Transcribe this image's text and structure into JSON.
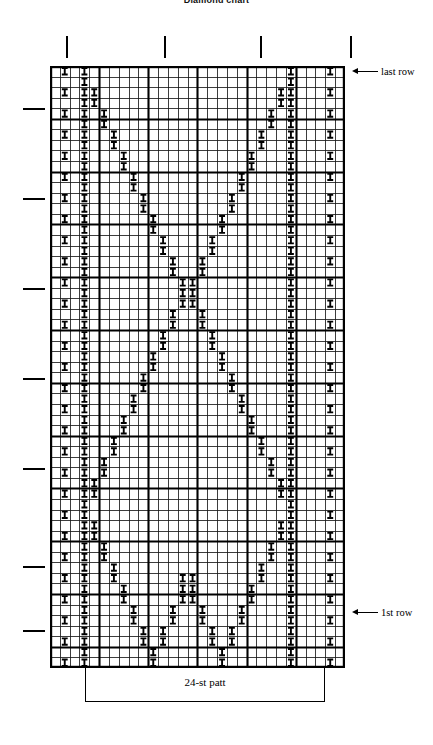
{
  "title": "Diamond chart",
  "annotations": {
    "last_row": "last row",
    "first_row": "1st row",
    "pattern_repeat": "24-st patt"
  },
  "chart_data": {
    "type": "table",
    "title": "Diamond chart",
    "xlabel": "",
    "ylabel": "",
    "symbol": "I",
    "columns": 30,
    "rows": 57,
    "repeat_stitches": 24,
    "repeat_start_col": 4,
    "repeat_end_col": 27,
    "cell_width": 9.833,
    "cell_height": 10.561,
    "heavy_col_every": 5,
    "heavy_row_every": 5,
    "row_order": "row 1 at bottom, last row at top",
    "col_ticks": [
      66,
      164,
      260,
      350
    ],
    "row_ticks": [
      108,
      198,
      288,
      378,
      468,
      566,
      630
    ],
    "grid_left": 50,
    "grid_top": 66,
    "grid_right": 345,
    "grid_bottom": 668,
    "marked_cells_by_row": [
      [
        3,
        10,
        17,
        24
      ],
      [
        3,
        10,
        17,
        24
      ],
      [
        3,
        9,
        11,
        16,
        18,
        24
      ],
      [
        3,
        9,
        11,
        16,
        18,
        24
      ],
      [
        3,
        8,
        12,
        15,
        19,
        24
      ],
      [
        3,
        8,
        12,
        15,
        19,
        24
      ],
      [
        3,
        7,
        13,
        14,
        20,
        24
      ],
      [
        3,
        7,
        13,
        14,
        20,
        24
      ],
      [
        3,
        6,
        14,
        13,
        21,
        24
      ],
      [
        3,
        6,
        21,
        24
      ],
      [
        3,
        5,
        22,
        24
      ],
      [
        3,
        5,
        22,
        24
      ],
      [
        3,
        4,
        23,
        24
      ],
      [
        3,
        4,
        23,
        24
      ],
      [
        3,
        24
      ],
      [
        3,
        24
      ],
      [
        3,
        4,
        23,
        24
      ],
      [
        3,
        4,
        23,
        24
      ],
      [
        3,
        5,
        22,
        24
      ],
      [
        3,
        5,
        22,
        24
      ],
      [
        3,
        6,
        21,
        24
      ],
      [
        3,
        6,
        21,
        24
      ],
      [
        3,
        7,
        20,
        24
      ],
      [
        3,
        7,
        20,
        24
      ],
      [
        3,
        8,
        19,
        24
      ],
      [
        3,
        8,
        19,
        24
      ],
      [
        3,
        9,
        18,
        24
      ],
      [
        3,
        9,
        18,
        24
      ],
      [
        3,
        10,
        17,
        24
      ],
      [
        3,
        10,
        17,
        24
      ],
      [
        3,
        11,
        16,
        24
      ],
      [
        3,
        11,
        16,
        24
      ],
      [
        3,
        12,
        15,
        24
      ],
      [
        3,
        12,
        15,
        24
      ],
      [
        3,
        13,
        14,
        24
      ],
      [
        3,
        13,
        14,
        24
      ],
      [
        3,
        13,
        14,
        24
      ],
      [
        3,
        12,
        15,
        24
      ],
      [
        3,
        12,
        15,
        24
      ],
      [
        3,
        11,
        16,
        24
      ],
      [
        3,
        11,
        16,
        24
      ],
      [
        3,
        10,
        17,
        24
      ],
      [
        3,
        10,
        17,
        24
      ],
      [
        3,
        9,
        18,
        24
      ],
      [
        3,
        9,
        18,
        24
      ],
      [
        3,
        8,
        19,
        24
      ],
      [
        3,
        8,
        19,
        24
      ],
      [
        3,
        7,
        20,
        24
      ],
      [
        3,
        7,
        20,
        24
      ],
      [
        3,
        6,
        21,
        24
      ],
      [
        3,
        6,
        21,
        24
      ],
      [
        3,
        5,
        22,
        24
      ],
      [
        3,
        5,
        22,
        24
      ],
      [
        3,
        4,
        23,
        24
      ],
      [
        3,
        4,
        23,
        24
      ],
      [
        3,
        24
      ],
      [
        3,
        24
      ]
    ]
  }
}
